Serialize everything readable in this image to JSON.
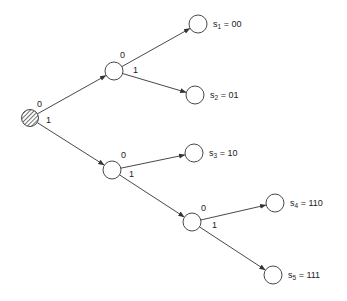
{
  "diagram": {
    "type": "binary-code-tree",
    "colors": {
      "stroke": "#333333",
      "node_fill": "#ffffff",
      "root_hatch": "#333333",
      "text": "#222222"
    },
    "nodes": [
      {
        "id": "root",
        "x": 30,
        "y": 118,
        "r": 8.5,
        "hatched": true
      },
      {
        "id": "n0",
        "x": 114,
        "y": 71,
        "r": 9
      },
      {
        "id": "n1",
        "x": 112,
        "y": 170,
        "r": 9
      },
      {
        "id": "n11",
        "x": 192,
        "y": 222,
        "r": 9
      },
      {
        "id": "s1",
        "x": 198,
        "y": 24,
        "r": 9
      },
      {
        "id": "s2",
        "x": 195,
        "y": 95,
        "r": 9
      },
      {
        "id": "s3",
        "x": 194,
        "y": 153,
        "r": 9
      },
      {
        "id": "s4",
        "x": 275,
        "y": 203,
        "r": 9
      },
      {
        "id": "s5",
        "x": 273,
        "y": 275,
        "r": 9
      }
    ],
    "edges": [
      {
        "from": "root",
        "to": "n0",
        "bit": "0",
        "lx": 37,
        "ly": 107
      },
      {
        "from": "root",
        "to": "n1",
        "bit": "1",
        "lx": 46,
        "ly": 123
      },
      {
        "from": "n0",
        "to": "s1",
        "bit": "0",
        "lx": 120,
        "ly": 58
      },
      {
        "from": "n0",
        "to": "s2",
        "bit": "1",
        "lx": 133,
        "ly": 73
      },
      {
        "from": "n1",
        "to": "s3",
        "bit": "0",
        "lx": 121,
        "ly": 158
      },
      {
        "from": "n1",
        "to": "s4_parent",
        "bit": "1",
        "lx": 129,
        "ly": 177
      },
      {
        "from": "n11",
        "to": "s4",
        "bit": "0",
        "lx": 201,
        "ly": 211
      },
      {
        "from": "n11",
        "to": "s5",
        "bit": "1",
        "lx": 212,
        "ly": 228
      }
    ],
    "leaves": [
      {
        "id": "s1",
        "symbol": "s",
        "index": "1",
        "code": "00"
      },
      {
        "id": "s2",
        "symbol": "s",
        "index": "2",
        "code": "01"
      },
      {
        "id": "s3",
        "symbol": "s",
        "index": "3",
        "code": "10"
      },
      {
        "id": "s4",
        "symbol": "s",
        "index": "4",
        "code": "110"
      },
      {
        "id": "s5",
        "symbol": "s",
        "index": "5",
        "code": "111"
      }
    ]
  }
}
